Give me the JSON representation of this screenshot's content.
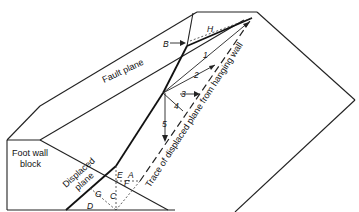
{
  "diagram": {
    "labels": {
      "fault_plane": "Fault plane",
      "foot_wall_line1": "Foot wall",
      "foot_wall_line2": "block",
      "displaced_line1": "Displaced",
      "displaced_line2": "plane",
      "trace": "Trace of displaced plane from hanging wall"
    },
    "points": {
      "A": "A",
      "B": "B",
      "C": "C",
      "D": "D",
      "E": "E",
      "F": "F",
      "G": "G",
      "H": "H"
    },
    "arrows": [
      "1",
      "2",
      "3",
      "4",
      "5"
    ]
  }
}
